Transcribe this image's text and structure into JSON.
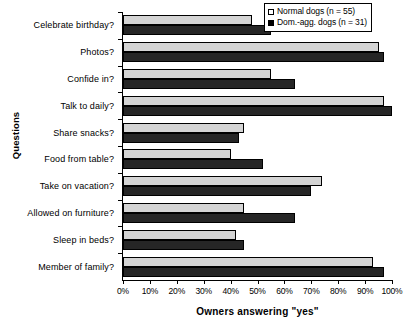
{
  "chart_data": {
    "type": "bar",
    "orientation": "horizontal",
    "title": "",
    "xlabel": "Owners answering \"yes\"",
    "ylabel": "Questions",
    "xlim": [
      0,
      100
    ],
    "xunit": "%",
    "grid": false,
    "legend_position": "top-right",
    "categories": [
      "Celebrate birthday?",
      "Photos?",
      "Confide in?",
      "Talk to daily?",
      "Share snacks?",
      "Food from table?",
      "Take on vacation?",
      "Allowed on furniture?",
      "Sleep in beds?",
      "Member of family?"
    ],
    "xticks": [
      0,
      10,
      20,
      30,
      40,
      50,
      60,
      70,
      80,
      90,
      100
    ],
    "xtick_labels": [
      "0%",
      "10%",
      "20%",
      "30%",
      "40%",
      "50%",
      "60%",
      "70%",
      "80%",
      "90%",
      "100%"
    ],
    "series": [
      {
        "name": "Normal dogs (n = 55)",
        "color": "#d4d4d4",
        "values": [
          48,
          95,
          55,
          97,
          45,
          40,
          74,
          45,
          42,
          93
        ]
      },
      {
        "name": "Dom.-agg. dogs (n = 31)",
        "color": "#262626",
        "values": [
          55,
          97,
          64,
          100,
          43,
          52,
          70,
          64,
          45,
          97
        ]
      }
    ]
  },
  "legend": {
    "items": [
      {
        "label": "Normal dogs (n = 55)",
        "marker": "open-square-marker"
      },
      {
        "label": "Dom.-agg. dogs (n = 31)",
        "marker": "filled-square-marker"
      }
    ]
  }
}
